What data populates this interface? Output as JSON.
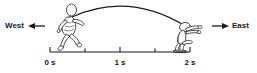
{
  "figure": {
    "type": "physics-motion-diagram",
    "background_color": "#ffffff",
    "ink_color": "#1a1a1a",
    "direction_labels": {
      "west": "West",
      "east": "East"
    },
    "arrows": [
      {
        "name": "west-arrow",
        "direction": "left",
        "from_x": 45,
        "to_x": 28,
        "y": 26
      },
      {
        "name": "east-arrow",
        "direction": "right",
        "from_x": 212,
        "to_x": 229,
        "y": 26
      }
    ],
    "figures": [
      {
        "name": "runner-launch",
        "pose": "running-leap",
        "facing": "left",
        "time_s": 0
      },
      {
        "name": "runner-landing",
        "pose": "crouched-landing",
        "facing": "right",
        "time_s": 2
      }
    ],
    "trajectory": {
      "name": "projectile-arc",
      "shape": "parabola",
      "start": {
        "x": 72,
        "y": 17
      },
      "peak": {
        "x": 128,
        "y": 4
      },
      "end": {
        "x": 187,
        "y": 27
      }
    },
    "timeline": {
      "axis_y": 52,
      "x_start": 50,
      "x_end": 190,
      "tick_count": 5,
      "tick_height": 5,
      "labels": [
        {
          "text": "0 s",
          "x": 50
        },
        {
          "text": "1 s",
          "x": 120
        },
        {
          "text": "2 s",
          "x": 190
        }
      ]
    }
  }
}
